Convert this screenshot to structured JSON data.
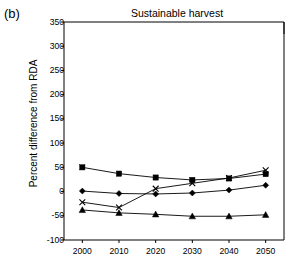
{
  "panel": {
    "label": "(b)"
  },
  "chart_data": {
    "type": "line",
    "title": "Sustainable harvest",
    "xlabel": "",
    "ylabel": "Percent difference from RDA",
    "x": [
      2000,
      2010,
      2020,
      2030,
      2040,
      2050
    ],
    "xticklabels": [
      "2000",
      "2010",
      "2020",
      "2030",
      "2040",
      "2050"
    ],
    "yticks": [
      -100,
      -50,
      0,
      50,
      100,
      150,
      200,
      250,
      300,
      350
    ],
    "yticklabels": [
      "-100",
      "-50",
      "0",
      "50",
      "100",
      "150",
      "200",
      "250",
      "300",
      "350"
    ],
    "ylim": [
      -100,
      350
    ],
    "xlim": [
      1995,
      2055
    ],
    "grid": false,
    "legend": "none",
    "series": [
      {
        "name": "series-1",
        "marker": "square",
        "values": [
          50,
          37,
          29,
          24,
          27,
          36
        ]
      },
      {
        "name": "series-2",
        "marker": "diamond",
        "values": [
          1,
          -4,
          -5,
          -3,
          3,
          13
        ]
      },
      {
        "name": "series-3",
        "marker": "cross",
        "values": [
          -22,
          -33,
          6,
          17,
          28,
          44
        ]
      },
      {
        "name": "series-4",
        "marker": "triangle",
        "values": [
          -38,
          -44,
          -47,
          -51,
          -51,
          -48
        ]
      }
    ],
    "colors": {
      "line": "#000000",
      "axis": "#000000",
      "background": "#ffffff"
    }
  }
}
